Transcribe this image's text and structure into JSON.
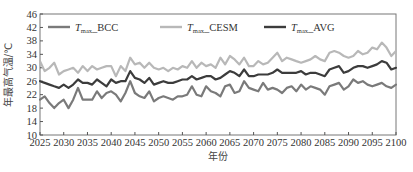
{
  "chart_data": {
    "type": "line",
    "title": "",
    "xlabel": "年份",
    "ylabel": "年最高气温/℃",
    "xlim": [
      2025,
      2100
    ],
    "ylim": [
      10,
      46
    ],
    "xticks": [
      2025,
      2030,
      2035,
      2040,
      2045,
      2050,
      2055,
      2060,
      2065,
      2070,
      2075,
      2080,
      2085,
      2090,
      2095,
      2100
    ],
    "yticks": [
      10,
      14,
      18,
      22,
      26,
      30,
      34,
      38,
      42,
      46
    ],
    "grid": false,
    "legend_position": "top-inside",
    "x": [
      2025,
      2026,
      2027,
      2028,
      2029,
      2030,
      2031,
      2032,
      2033,
      2034,
      2035,
      2036,
      2037,
      2038,
      2039,
      2040,
      2041,
      2042,
      2043,
      2044,
      2045,
      2046,
      2047,
      2048,
      2049,
      2050,
      2051,
      2052,
      2053,
      2054,
      2055,
      2056,
      2057,
      2058,
      2059,
      2060,
      2061,
      2062,
      2063,
      2064,
      2065,
      2066,
      2067,
      2068,
      2069,
      2070,
      2071,
      2072,
      2073,
      2074,
      2075,
      2076,
      2077,
      2078,
      2079,
      2080,
      2081,
      2082,
      2083,
      2084,
      2085,
      2086,
      2087,
      2088,
      2089,
      2090,
      2091,
      2092,
      2093,
      2094,
      2095,
      2096,
      2097,
      2098,
      2099,
      2100
    ],
    "series": [
      {
        "name": "T_max_BCC",
        "legend_main": "T",
        "legend_sub": "max",
        "legend_suffix": "_BCC",
        "color": "#7a7a7a",
        "values": [
          20.5,
          21.5,
          19.5,
          18.0,
          19.5,
          20.5,
          18.0,
          20.5,
          24.0,
          20.5,
          20.5,
          20.5,
          23.0,
          21.0,
          22.5,
          23.0,
          22.0,
          20.0,
          22.5,
          26.0,
          22.5,
          21.5,
          21.0,
          23.0,
          20.0,
          21.0,
          21.5,
          21.0,
          20.5,
          21.5,
          21.5,
          22.0,
          24.5,
          22.0,
          21.5,
          24.5,
          23.0,
          22.5,
          21.5,
          24.5,
          25.0,
          22.5,
          23.0,
          26.0,
          24.0,
          23.5,
          23.0,
          25.5,
          23.5,
          24.0,
          23.5,
          22.5,
          24.0,
          24.5,
          23.0,
          25.0,
          23.5,
          24.5,
          24.0,
          23.5,
          22.0,
          24.5,
          25.0,
          25.5,
          23.5,
          24.5,
          26.5,
          25.5,
          26.0,
          25.0,
          24.5,
          25.0,
          25.5,
          24.5,
          24.0,
          25.0
        ]
      },
      {
        "name": "T_max_CESM",
        "legend_main": "T",
        "legend_sub": "max",
        "legend_suffix": "_CESM",
        "color": "#b8b8b8",
        "values": [
          32.0,
          29.0,
          30.0,
          31.5,
          28.0,
          29.0,
          29.5,
          30.0,
          28.5,
          30.5,
          29.0,
          30.5,
          29.5,
          30.0,
          30.5,
          30.5,
          27.5,
          30.5,
          29.0,
          33.0,
          31.0,
          31.5,
          30.0,
          31.5,
          30.0,
          29.5,
          30.0,
          29.0,
          30.0,
          29.5,
          30.5,
          30.0,
          32.0,
          30.0,
          31.5,
          30.5,
          31.0,
          30.0,
          33.0,
          31.0,
          33.5,
          32.5,
          31.0,
          33.0,
          30.5,
          30.5,
          32.0,
          31.0,
          31.5,
          33.0,
          34.5,
          32.0,
          33.0,
          32.5,
          32.0,
          31.5,
          32.0,
          32.5,
          33.5,
          32.5,
          32.0,
          34.5,
          35.0,
          34.5,
          33.5,
          33.0,
          33.5,
          35.0,
          34.0,
          34.5,
          36.0,
          35.5,
          37.5,
          36.0,
          33.5,
          35.0
        ]
      },
      {
        "name": "T_max_AVG",
        "legend_main": "T",
        "legend_sub": "max",
        "legend_suffix": "_AVG",
        "color": "#3c3c3c",
        "values": [
          26.0,
          25.5,
          25.0,
          24.5,
          24.0,
          25.0,
          24.0,
          25.0,
          26.5,
          25.5,
          25.5,
          25.0,
          26.5,
          25.5,
          24.5,
          26.5,
          25.5,
          26.0,
          26.0,
          29.0,
          27.0,
          26.5,
          25.5,
          27.0,
          25.0,
          25.5,
          26.0,
          25.5,
          25.5,
          26.0,
          26.5,
          26.5,
          27.5,
          26.5,
          27.0,
          27.5,
          27.5,
          26.5,
          27.0,
          28.0,
          29.0,
          28.5,
          27.5,
          29.5,
          27.5,
          27.5,
          28.0,
          28.0,
          28.0,
          28.5,
          29.5,
          28.5,
          28.5,
          28.5,
          28.5,
          29.0,
          28.0,
          28.5,
          28.5,
          28.0,
          27.5,
          29.5,
          30.0,
          30.5,
          28.5,
          29.0,
          30.0,
          30.5,
          30.5,
          30.0,
          30.5,
          31.0,
          32.0,
          31.5,
          29.5,
          30.0
        ]
      }
    ]
  },
  "axes": {
    "x_title": "年份",
    "y_title": "年最高气温/℃"
  },
  "legend": [
    {
      "main": "T",
      "sub": "max",
      "suffix": "_BCC",
      "color": "#7a7a7a"
    },
    {
      "main": "T",
      "sub": "max",
      "suffix": "_CESM",
      "color": "#b8b8b8"
    },
    {
      "main": "T",
      "sub": "max",
      "suffix": "_AVG",
      "color": "#3c3c3c"
    }
  ]
}
